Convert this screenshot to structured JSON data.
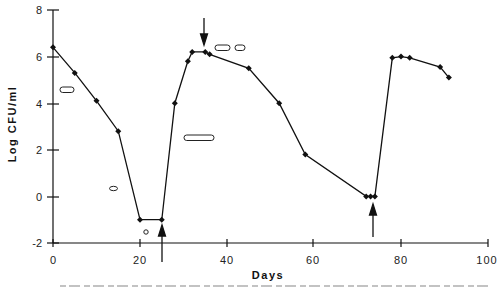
{
  "chart_data": {
    "type": "line",
    "title": "",
    "xlabel": "Days",
    "ylabel": "Log CFU/ml",
    "xlim": [
      0,
      100
    ],
    "ylim": [
      -2,
      8
    ],
    "xticks": [
      0,
      20,
      40,
      60,
      80,
      100
    ],
    "yticks": [
      -2,
      0,
      2,
      4,
      6,
      8
    ],
    "grid": false,
    "legend": null,
    "series": [
      {
        "name": "Log CFU/ml",
        "marker": "diamond",
        "color": "#111111",
        "x": [
          0,
          5,
          10,
          15,
          20,
          25,
          28,
          31,
          32,
          35,
          36,
          45,
          52,
          58,
          72,
          73,
          74,
          78,
          80,
          82,
          89,
          91
        ],
        "y": [
          6.4,
          5.3,
          4.1,
          2.8,
          -1.0,
          -1.0,
          4.0,
          5.8,
          6.2,
          6.2,
          6.1,
          5.5,
          4.0,
          1.8,
          0.0,
          0.0,
          0.0,
          5.95,
          6.0,
          5.95,
          5.55,
          5.1
        ]
      }
    ],
    "annotations": [
      {
        "type": "arrow-up",
        "x": 25,
        "description": "arrow pointing up at day 25 from below axis"
      },
      {
        "type": "arrow-down",
        "x": 35,
        "description": "arrow pointing down at day 35 peak"
      },
      {
        "type": "arrow-up",
        "x": 73,
        "description": "arrow pointing up at day 73"
      },
      {
        "type": "cell-shape",
        "shape": "short rod",
        "x": 3,
        "y": 4.6
      },
      {
        "type": "cell-shape",
        "shape": "oval",
        "x": 14,
        "y": 0.4
      },
      {
        "type": "cell-shape",
        "shape": "coccus",
        "x": 21,
        "y": -1.5
      },
      {
        "type": "cell-shape",
        "shape": "long rod",
        "x": 34,
        "y": 2.55
      },
      {
        "type": "cell-shape",
        "shape": "short rod",
        "x": 39,
        "y": 6.4
      },
      {
        "type": "cell-shape",
        "shape": "short rod",
        "x": 43,
        "y": 6.4
      }
    ]
  },
  "labels": {
    "ylabel": "Log CFU/ml",
    "xlabel": "Days",
    "xticks": [
      "0",
      "20",
      "40",
      "60",
      "80",
      "100"
    ],
    "yticks": [
      "8",
      "6",
      "4",
      "2",
      "0",
      "-2"
    ]
  }
}
